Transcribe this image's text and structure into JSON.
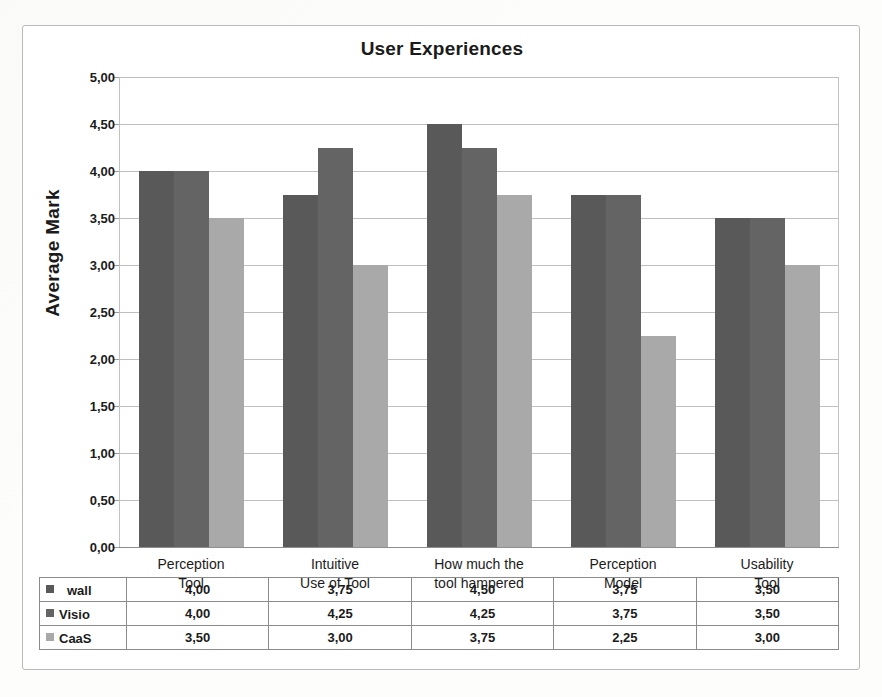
{
  "chart_data": {
    "type": "bar",
    "title": "User Experiences",
    "xlabel": "",
    "ylabel": "Average Mark",
    "ylim": [
      0,
      5
    ],
    "ytick_step": 0.5,
    "grid": true,
    "legend_position": "data-table-below",
    "decimal_separator": ",",
    "categories": [
      "Perception\nTool",
      "Intuitive\nUse of Tool",
      "How much the\ntool hampered",
      "Perception\nModel",
      "Usability\nTool"
    ],
    "category_lines": [
      [
        "Perception",
        "Tool"
      ],
      [
        "Intuitive",
        "Use of Tool"
      ],
      [
        "How much the",
        "tool hampered"
      ],
      [
        "Perception",
        "Model"
      ],
      [
        "Usability",
        "Tool"
      ]
    ],
    "ytick_labels": [
      "0,00",
      "0,50",
      "1,00",
      "1,50",
      "2,00",
      "2,50",
      "3,00",
      "3,50",
      "4,00",
      "4,50",
      "5,00"
    ],
    "ytick_values": [
      0,
      0.5,
      1,
      1.5,
      2,
      2.5,
      3,
      3.5,
      4,
      4.5,
      5
    ],
    "series": [
      {
        "name": "wall",
        "color": "#595959",
        "values": [
          4.0,
          3.75,
          4.5,
          3.75,
          3.5
        ],
        "labels": [
          "4,00",
          "3,75",
          "4,50",
          "3,75",
          "3,50"
        ]
      },
      {
        "name": "Visio",
        "color": "#646464",
        "values": [
          4.0,
          4.25,
          4.25,
          3.75,
          3.5
        ],
        "labels": [
          "4,00",
          "4,25",
          "4,25",
          "3,75",
          "3,50"
        ]
      },
      {
        "name": "CaaS",
        "color": "#a9a9a9",
        "values": [
          3.5,
          3.0,
          3.75,
          2.25,
          3.0
        ],
        "labels": [
          "3,50",
          "3,00",
          "3,75",
          "2,25",
          "3,00"
        ]
      }
    ]
  },
  "table": {
    "rows": [
      {
        "legend": "wall",
        "swatch": "#595959",
        "cells": [
          "4,00",
          "3,75",
          "4,50",
          "3,75",
          "3,50"
        ]
      },
      {
        "legend": "Visio",
        "swatch": "#646464",
        "cells": [
          "4,00",
          "4,25",
          "4,25",
          "3,75",
          "3,50"
        ]
      },
      {
        "legend": "CaaS",
        "swatch": "#a9a9a9",
        "cells": [
          "3,50",
          "3,00",
          "3,75",
          "2,25",
          "3,00"
        ]
      }
    ]
  }
}
